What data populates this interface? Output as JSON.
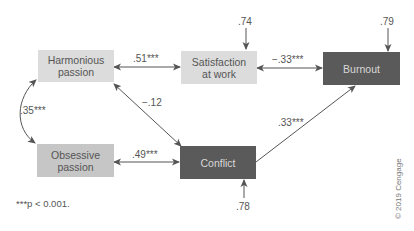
{
  "nodes": {
    "harmonious": {
      "label_line1": "Harmonious",
      "label_line2": "passion",
      "color": "#dcdcdc"
    },
    "satisfaction": {
      "label_line1": "Satisfaction",
      "label_line2": "at work",
      "color": "#dcdcdc"
    },
    "burnout": {
      "label": "Burnout",
      "color": "#5a5a5a"
    },
    "obsessive": {
      "label_line1": "Obsessive",
      "label_line2": "passion",
      "color": "#c6c6c6"
    },
    "conflict": {
      "label": "Conflict",
      "color": "#5a5a5a"
    }
  },
  "edges": {
    "harmonious_satisfaction": ".51***",
    "satisfaction_burnout": "−.33***",
    "harmonious_conflict": "−.12",
    "harmonious_obsessive": ".35***",
    "obsessive_conflict": ".49***",
    "conflict_burnout": ".33***"
  },
  "residuals": {
    "satisfaction": ".74",
    "burnout": ".79",
    "conflict": ".78"
  },
  "footnote": "***p < 0.001.",
  "credit": "© 2019 Cengage"
}
